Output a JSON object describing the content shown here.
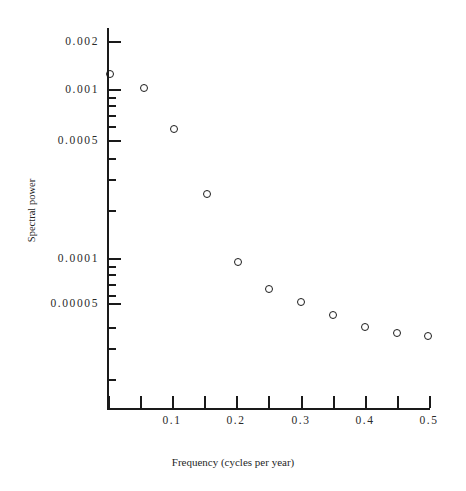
{
  "figure": {
    "width": 466,
    "height": 491,
    "background": "#ffffff",
    "ink_color": "#1a1a1a"
  },
  "axis_titles": {
    "x": "Frequency (cycles per year)",
    "y": "Spectral power"
  },
  "y_tick_labels": [
    {
      "text": "0.002",
      "value": 0.002,
      "y": 41
    },
    {
      "text": "0.001",
      "value": 0.001,
      "y": 89
    },
    {
      "text": "0.0005",
      "value": 0.0005,
      "y": 140
    },
    {
      "text": "0.0001",
      "value": 0.0001,
      "y": 258
    },
    {
      "text": "0.00005",
      "value": 5e-05,
      "y": 303
    }
  ],
  "y_minor_ticks": [
    {
      "value": 0.0009,
      "y": 97
    },
    {
      "value": 0.0008,
      "y": 105
    },
    {
      "value": 0.0007,
      "y": 115
    },
    {
      "value": 0.0006,
      "y": 126
    },
    {
      "value": 0.0004,
      "y": 158
    },
    {
      "value": 0.0003,
      "y": 179
    },
    {
      "value": 0.0002,
      "y": 210
    },
    {
      "value": 9e-05,
      "y": 266
    },
    {
      "value": 8e-05,
      "y": 274
    },
    {
      "value": 7e-05,
      "y": 284
    },
    {
      "value": 6e-05,
      "y": 295
    },
    {
      "value": 4e-05,
      "y": 327
    },
    {
      "value": 3e-05,
      "y": 348
    },
    {
      "value": 2e-05,
      "y": 379
    }
  ],
  "x_tick_labels": [
    {
      "text": "0.1",
      "value": 0.1,
      "x": 172
    },
    {
      "text": "0.2",
      "value": 0.2,
      "x": 236
    },
    {
      "text": "0.3",
      "value": 0.3,
      "x": 301
    },
    {
      "text": "0.4",
      "value": 0.4,
      "x": 365
    },
    {
      "text": "0.5",
      "value": 0.5,
      "x": 429
    }
  ],
  "x_ticks_all": [
    {
      "value": 0.0,
      "x": 108
    },
    {
      "value": 0.05,
      "x": 140
    },
    {
      "value": 0.1,
      "x": 172
    },
    {
      "value": 0.15,
      "x": 204
    },
    {
      "value": 0.2,
      "x": 236
    },
    {
      "value": 0.25,
      "x": 268
    },
    {
      "value": 0.3,
      "x": 301
    },
    {
      "value": 0.35,
      "x": 333
    },
    {
      "value": 0.4,
      "x": 365
    },
    {
      "value": 0.45,
      "x": 397
    },
    {
      "value": 0.5,
      "x": 429
    }
  ],
  "chart_data": {
    "type": "scatter",
    "title": "",
    "xlabel": "Frequency (cycles per year)",
    "ylabel": "Spectral power",
    "yscale": "log",
    "xscale": "linear",
    "xlim": [
      0.0,
      0.5
    ],
    "ylim": [
      1.8e-05,
      0.0024
    ],
    "grid": false,
    "legend": null,
    "marker": "open-circle",
    "x": [
      0.005,
      0.05,
      0.1,
      0.15,
      0.2,
      0.25,
      0.3,
      0.35,
      0.4,
      0.45,
      0.5
    ],
    "y": [
      0.0013,
      0.00101,
      0.00058,
      0.00027,
      9.2e-05,
      6.2e-05,
      5e-05,
      4.25e-05,
      3.65e-05,
      3.37e-05,
      3.28e-05
    ],
    "points": [
      {
        "x": 0.005,
        "y": 0.0013,
        "px": 110,
        "py": 74
      },
      {
        "x": 0.05,
        "y": 0.00101,
        "px": 144,
        "py": 88
      },
      {
        "x": 0.1,
        "y": 0.00058,
        "px": 174,
        "py": 129
      },
      {
        "x": 0.15,
        "y": 0.00027,
        "px": 207,
        "py": 194
      },
      {
        "x": 0.2,
        "y": 9.2e-05,
        "px": 238,
        "py": 262
      },
      {
        "x": 0.25,
        "y": 6.2e-05,
        "px": 269,
        "py": 289
      },
      {
        "x": 0.3,
        "y": 5e-05,
        "px": 301,
        "py": 302
      },
      {
        "x": 0.35,
        "y": 4.25e-05,
        "px": 333,
        "py": 315
      },
      {
        "x": 0.4,
        "y": 3.65e-05,
        "px": 365,
        "py": 327
      },
      {
        "x": 0.45,
        "y": 3.37e-05,
        "px": 397,
        "py": 333
      },
      {
        "x": 0.5,
        "y": 3.28e-05,
        "px": 428,
        "py": 336
      }
    ]
  }
}
